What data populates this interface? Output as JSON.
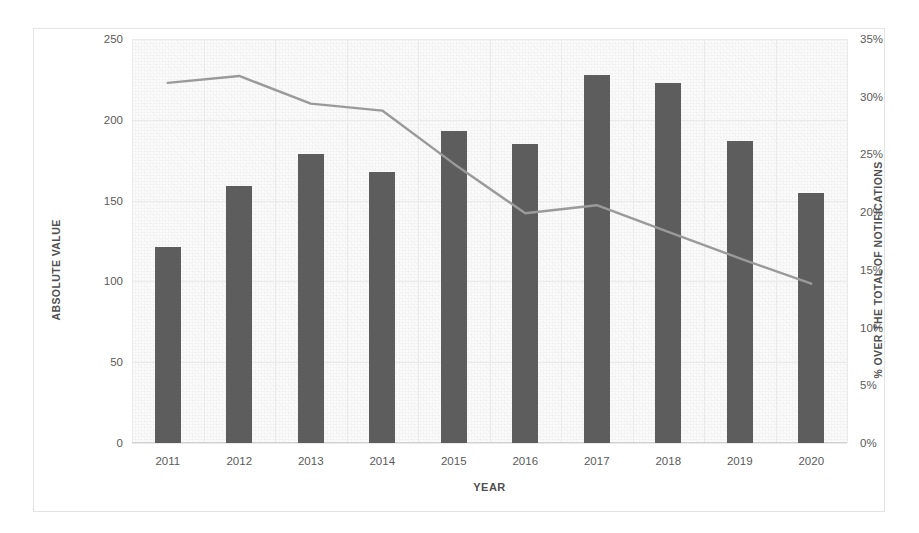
{
  "chart_data": {
    "type": "bar",
    "title": "",
    "subtitle": "",
    "xlabel": "YEAR",
    "ylabel": "ABSOLUTE VALUE",
    "y2label": "% OVER THE TOTAL OF NOTIFICATIONS",
    "categories": [
      "2011",
      "2012",
      "2013",
      "2014",
      "2015",
      "2016",
      "2017",
      "2018",
      "2019",
      "2020"
    ],
    "ylim": [
      0,
      250
    ],
    "y2lim": [
      0,
      35
    ],
    "yticks": [
      "0",
      "50",
      "100",
      "150",
      "200",
      "250"
    ],
    "ytick_values": [
      0,
      50,
      100,
      150,
      200,
      250
    ],
    "y2ticks": [
      "0%",
      "5%",
      "10%",
      "15%",
      "20%",
      "25%",
      "30%",
      "35%"
    ],
    "y2tick_values": [
      0,
      5,
      10,
      15,
      20,
      25,
      30,
      35
    ],
    "grid": true,
    "legend": "none",
    "series": [
      {
        "name": "ABSOLUTE VALUE",
        "kind": "bar",
        "axis": "left",
        "color": "#5d5d5d",
        "values": [
          121,
          159,
          179,
          168,
          193,
          185,
          228,
          223,
          187,
          155
        ]
      },
      {
        "name": "% OVER THE TOTAL OF NOTIFICATIONS",
        "kind": "line",
        "axis": "right",
        "color": "#9a9a9a",
        "values": [
          31.2,
          31.8,
          29.4,
          28.8,
          24.2,
          19.9,
          20.6,
          18.3,
          16.0,
          13.8
        ]
      }
    ]
  },
  "figure": {
    "background": "#ffffff",
    "plot_background": "#fbfbfb",
    "border_color": "#e3e3e3",
    "grid_color": "#eaeaea",
    "bar_color": "#5d5d5d",
    "line_color": "#9a9a9a",
    "tick_text_color": "#5a5a5a",
    "axis_title_color": "#4f4f4f"
  }
}
